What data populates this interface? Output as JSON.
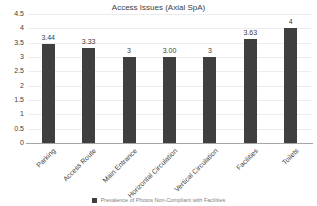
{
  "chart_data": {
    "type": "bar",
    "title": "Access Issues (Axial SpA)",
    "categories": [
      "Parking",
      "Access Route",
      "Main Entrance",
      "Horizontal Circulation",
      "Vertical Circulation",
      "Facilities",
      "Toilets"
    ],
    "values": [
      3.44,
      3.33,
      3,
      3,
      3,
      3.63,
      4
    ],
    "data_labels": [
      "3.44",
      "3.33",
      "3",
      "3.00",
      "3",
      "3.63",
      "4"
    ],
    "ylabel": "",
    "xlabel": "",
    "ylim": [
      0,
      4.5
    ],
    "ytick_step": 0.5,
    "ytick_labels": [
      "4.5",
      "4",
      "3.5",
      "3",
      "2.5",
      "2",
      "1.5",
      "1",
      "0.5",
      "0"
    ],
    "grid": "horizontal-light",
    "legend": {
      "position": "bottom",
      "marker": "square",
      "label": "Prevalence of Photos Non-Compliant with Facilities"
    },
    "colors": {
      "bar": "#3f3f3f",
      "text": "#404040",
      "axis": "#a6a6a6",
      "gridline": "#ececec",
      "legend_text": "#7f7f7f",
      "background": "#ffffff"
    }
  }
}
